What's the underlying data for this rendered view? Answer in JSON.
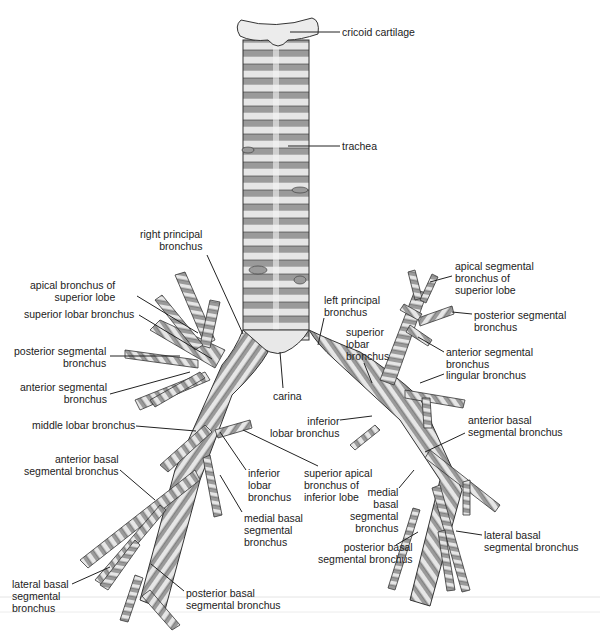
{
  "diagram": {
    "colors": {
      "cartilage": "#e6e6e6",
      "membrane": "#9a9a9a",
      "outline": "#333333",
      "leader": "#222222",
      "text": "#222222"
    },
    "labels": [
      {
        "id": "cricoid-cartilage",
        "text": "cricoid cartilage",
        "x": 342,
        "y": 26,
        "align": "l",
        "lx1": 290,
        "ly1": 32,
        "lx2": 340,
        "ly2": 32
      },
      {
        "id": "trachea",
        "text": "trachea",
        "x": 342,
        "y": 140,
        "align": "l",
        "lx1": 288,
        "ly1": 146,
        "lx2": 340,
        "ly2": 146
      },
      {
        "id": "right-principal-bronchus",
        "text": "right principal\nbronchus",
        "x": 140,
        "y": 228,
        "align": "r",
        "lx1": 207,
        "ly1": 255,
        "lx2": 243,
        "ly2": 334
      },
      {
        "id": "apical-bronchus-superior-lobe",
        "text": "apical bronchus of\nsuperior lobe",
        "x": 30,
        "y": 279,
        "align": "r",
        "lx1": 137,
        "ly1": 296,
        "lx2": 198,
        "ly2": 333
      },
      {
        "id": "superior-lobar-bronchus-right",
        "text": "superior lobar bronchus",
        "x": 24,
        "y": 308,
        "align": "r",
        "lx1": 139,
        "ly1": 315,
        "lx2": 212,
        "ly2": 359
      },
      {
        "id": "posterior-segmental-bronchus-right",
        "text": "posterior segmental\nbronchus",
        "x": 14,
        "y": 345,
        "align": "r",
        "lx1": 110,
        "ly1": 356,
        "lx2": 180,
        "ly2": 356
      },
      {
        "id": "anterior-segmental-bronchus-right",
        "text": "anterior segmental\nbronchus",
        "x": 20,
        "y": 381,
        "align": "r",
        "lx1": 110,
        "ly1": 394,
        "lx2": 190,
        "ly2": 372
      },
      {
        "id": "middle-lobar-bronchus",
        "text": "middle lobar bronchus",
        "x": 32,
        "y": 419,
        "align": "r",
        "lx1": 136,
        "ly1": 426,
        "lx2": 196,
        "ly2": 431
      },
      {
        "id": "carina",
        "text": "carina",
        "x": 273,
        "y": 390,
        "align": "l",
        "lx1": 283,
        "ly1": 388,
        "lx2": 280,
        "ly2": 352
      },
      {
        "id": "left-principal-bronchus",
        "text": "left principal\nbronchus",
        "x": 324,
        "y": 294,
        "align": "l",
        "lx1": 324,
        "ly1": 318,
        "lx2": 318,
        "ly2": 345
      },
      {
        "id": "superior-lobar-bronchus-left",
        "text": "superior\nlobar\nbronchus",
        "x": 346,
        "y": 326,
        "align": "l",
        "lx1": 364,
        "ly1": 363,
        "lx2": 372,
        "ly2": 383
      },
      {
        "id": "inferior-lobar-bronchus-left",
        "text": "inferior\nlobar bronchus",
        "x": 270,
        "y": 415,
        "align": "r",
        "lx1": 340,
        "ly1": 420,
        "lx2": 372,
        "ly2": 416
      },
      {
        "id": "superior-apical-bronchus-inferior-lobe",
        "text": "superior apical\nbronchus of\ninferior lobe",
        "x": 304,
        "y": 467,
        "align": "l",
        "lx1": 318,
        "ly1": 466,
        "lx2": 243,
        "ly2": 430
      },
      {
        "id": "apical-segmental-bronchus-superior-lobe",
        "text": "apical segmental\nbronchus of\nsuperior lobe",
        "x": 455,
        "y": 260,
        "align": "l",
        "lx1": 452,
        "ly1": 276,
        "lx2": 430,
        "ly2": 282
      },
      {
        "id": "posterior-segmental-bronchus-left",
        "text": "posterior segmental\nbronchus",
        "x": 474,
        "y": 309,
        "align": "l",
        "lx1": 472,
        "ly1": 314,
        "lx2": 452,
        "ly2": 312
      },
      {
        "id": "anterior-segmental-bronchus-left",
        "text": "anterior segmental\nbronchus",
        "x": 446,
        "y": 346,
        "align": "l",
        "lx1": 444,
        "ly1": 352,
        "lx2": 418,
        "ly2": 337
      },
      {
        "id": "lingular-bronchus",
        "text": "lingular bronchus",
        "x": 446,
        "y": 369,
        "align": "l",
        "lx1": 444,
        "ly1": 374,
        "lx2": 420,
        "ly2": 383
      },
      {
        "id": "anterior-basal-segmental-bronchus-left",
        "text": "anterior basal\nsegmental bronchus",
        "x": 468,
        "y": 414,
        "align": "l",
        "lx1": 465,
        "ly1": 433,
        "lx2": 425,
        "ly2": 452
      },
      {
        "id": "inferior-lobar-bronchus-right",
        "text": "inferior\nlobar\nbronchus",
        "x": 248,
        "y": 467,
        "align": "l",
        "lx1": 246,
        "ly1": 470,
        "lx2": 220,
        "ly2": 432
      },
      {
        "id": "medial-basal-segmental-bronchus-right",
        "text": "medial basal\nsegmental\nbronchus",
        "x": 244,
        "y": 512,
        "align": "l",
        "lx1": 242,
        "ly1": 512,
        "lx2": 220,
        "ly2": 475
      },
      {
        "id": "medial-basal-segmental-bronchus-left",
        "text": "medial\nbasal\nsegmental\nbronchus",
        "x": 350,
        "y": 486,
        "align": "r",
        "lx1": 399,
        "ly1": 488,
        "lx2": 414,
        "ly2": 470
      },
      {
        "id": "anterior-basal-segmental-bronchus-right",
        "text": "anterior basal\nsegmental bronchus",
        "x": 24,
        "y": 453,
        "align": "r",
        "lx1": 120,
        "ly1": 470,
        "lx2": 155,
        "ly2": 500
      },
      {
        "id": "lateral-basal-segmental-bronchus-left",
        "text": "lateral basal\nsegmental bronchus",
        "x": 484,
        "y": 529,
        "align": "l",
        "lx1": 482,
        "ly1": 535,
        "lx2": 456,
        "ly2": 531
      },
      {
        "id": "posterior-basal-segmental-bronchus-left",
        "text": "posterior basal\nsegmental bronchus",
        "x": 318,
        "y": 541,
        "align": "r",
        "lx1": 396,
        "ly1": 545,
        "lx2": 418,
        "ly2": 532
      },
      {
        "id": "lateral-basal-segmental-bronchus-right",
        "text": "lateral basal\nsegmental\nbronchus",
        "x": 12,
        "y": 578,
        "align": "l",
        "lx1": 72,
        "ly1": 584,
        "lx2": 110,
        "ly2": 567
      },
      {
        "id": "posterior-basal-segmental-bronchus-right",
        "text": "posterior basal\nsegmental bronchus",
        "x": 186,
        "y": 587,
        "align": "l",
        "lx1": 184,
        "ly1": 591,
        "lx2": 151,
        "ly2": 564
      }
    ]
  }
}
